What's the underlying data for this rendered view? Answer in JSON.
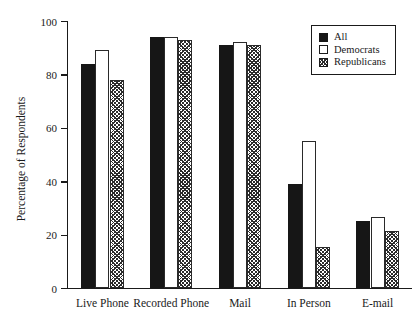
{
  "chart_data": {
    "type": "bar",
    "title": "",
    "xlabel": "",
    "ylabel": "Percentage of Respondents",
    "ylim": [
      0,
      100
    ],
    "yticks": [
      0,
      20,
      40,
      60,
      80,
      100
    ],
    "ytick_labels": [
      "0",
      "20",
      "40",
      "60",
      "80",
      "100"
    ],
    "grid": false,
    "legend_position": "top-right",
    "categories": [
      "Live Phone",
      "Recorded Phone",
      "Mail",
      "In Person",
      "E-mail"
    ],
    "series": [
      {
        "name": "All",
        "style": "solid-black",
        "color": "#161616",
        "values": [
          84,
          94,
          91,
          39,
          25
        ]
      },
      {
        "name": "Democrats",
        "style": "open-white",
        "color": "#ffffff",
        "values": [
          89,
          94,
          92,
          55,
          26.5
        ]
      },
      {
        "name": "Republicans",
        "style": "crosshatch",
        "color": "#2b2b2b",
        "values": [
          78,
          93,
          91,
          15.5,
          21.5
        ]
      }
    ]
  },
  "legend": {
    "entries": [
      {
        "label": "All"
      },
      {
        "label": "Democrats"
      },
      {
        "label": "Republicans"
      }
    ]
  }
}
